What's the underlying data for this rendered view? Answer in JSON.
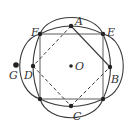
{
  "figure": {
    "type": "geometry-diagram",
    "center_label": "O",
    "points": [
      {
        "label": "A",
        "x": 71,
        "y": 26
      },
      {
        "label": "B",
        "x": 110,
        "y": 67
      },
      {
        "label": "C",
        "x": 71,
        "y": 106
      },
      {
        "label": "D",
        "x": 33,
        "y": 66
      },
      {
        "label": "E",
        "x": 103,
        "y": 34
      },
      {
        "label": "F",
        "x": 40,
        "y": 34
      },
      {
        "label": "G",
        "x": 16,
        "y": 65
      },
      {
        "label": "O",
        "x": 71,
        "y": 66
      }
    ],
    "unlabeled_points": [
      {
        "name": "bottom-left-corner",
        "x": 40,
        "y": 99
      },
      {
        "name": "bottom-right-corner",
        "x": 103,
        "y": 99
      }
    ],
    "segments_solid": [
      "F-E",
      "E-bottom-right",
      "bottom-right-bottom-left",
      "bottom-left-F",
      "A-B"
    ],
    "segments_dashed": [
      "A-D",
      "D-C",
      "C-B"
    ],
    "labels": {
      "A": "A",
      "B": "B",
      "C": "C",
      "D": "D",
      "E": "E",
      "F": "F",
      "G": "G",
      "O": "O"
    },
    "colors": {
      "stroke": "#3a3a3a",
      "square": "#777777",
      "point": "#222222"
    }
  }
}
